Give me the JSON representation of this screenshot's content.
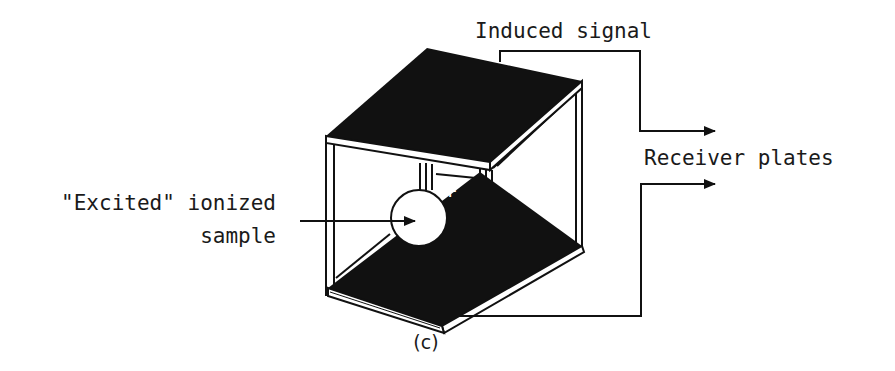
{
  "figure": {
    "caption": "(c)"
  },
  "labels": {
    "induced_signal": "Induced signal",
    "receiver_plates": "Receiver plates",
    "sample_line1": "\"Excited\" ionized",
    "sample_line2": "sample",
    "ion_charge": "+"
  },
  "colors": {
    "ink": "#111111",
    "background": "#ffffff"
  }
}
